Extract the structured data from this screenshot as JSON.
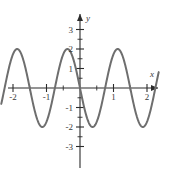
{
  "chart_data": {
    "type": "line",
    "title": "",
    "xlabel": "x",
    "ylabel": "y",
    "xlim": [
      -2.35,
      2.35
    ],
    "ylim": [
      -3.55,
      3.55
    ],
    "grid": false,
    "legend": "none",
    "curve_color": "#6e6e6e",
    "axis_color": "#2b2b2b",
    "label_color": "#3a3a3a",
    "x_ticks": [
      -2,
      -1,
      1,
      2
    ],
    "x_tick_labels": [
      "-2",
      "-1",
      "1",
      "2"
    ],
    "y_ticks": [
      -3,
      -2,
      -1,
      1,
      2,
      3
    ],
    "y_tick_labels": [
      "-3",
      "-2",
      "-1",
      "1",
      "2",
      "3"
    ],
    "minor_x_ticks": [
      -1.5,
      -0.5,
      0.5,
      1.5
    ],
    "minor_y_ticks": [
      -2.5,
      -1.5,
      -0.5,
      0.5,
      1.5,
      2.5
    ],
    "series": [
      {
        "name": "curve",
        "description": "sinusoid amplitude 2 period 1.5",
        "amplitude": 2,
        "period": 1.5,
        "phase": 0,
        "x": [
          -2.3,
          -2.2,
          -2.1,
          -2.0,
          -1.9,
          -1.8,
          -1.7,
          -1.6,
          -1.5,
          -1.4,
          -1.3,
          -1.2,
          -1.1,
          -1.0,
          -0.9,
          -0.8,
          -0.7,
          -0.6,
          -0.5,
          -0.4,
          -0.3,
          -0.2,
          -0.1,
          0.0,
          0.1,
          0.2,
          0.3,
          0.4,
          0.5,
          0.6,
          0.7,
          0.8,
          0.9,
          1.0,
          1.1,
          1.2,
          1.3,
          1.4,
          1.5,
          1.6,
          1.7,
          1.8,
          1.9,
          2.0,
          2.1,
          2.2,
          2.3
        ],
        "y": [
          -1.73,
          -1.0,
          -0.0,
          1.0,
          1.73,
          2.0,
          1.73,
          1.0,
          0.0,
          -1.0,
          -1.73,
          -2.0,
          -1.73,
          -1.0,
          0.0,
          1.0,
          1.73,
          2.0,
          1.73,
          1.0,
          0.0,
          -1.0,
          -1.73,
          -2.0,
          -1.73,
          -1.0,
          0.0,
          1.0,
          1.73,
          2.0,
          1.73,
          1.0,
          0.0,
          -1.0,
          -1.73,
          -2.0,
          -1.73,
          -1.0,
          0.0,
          1.0,
          1.73,
          2.0,
          1.73,
          1.0,
          0.0,
          -1.0,
          -1.73
        ]
      }
    ],
    "maxima": [
      {
        "x": -1.8,
        "y": 2
      },
      {
        "x": -0.6,
        "y": 2
      },
      {
        "x": 0.6,
        "y": 2
      },
      {
        "x": 1.8,
        "y": 2
      }
    ],
    "minima": [
      {
        "x": -1.2,
        "y": -2
      },
      {
        "x": 0.0,
        "y": -2
      },
      {
        "x": 1.2,
        "y": -2
      }
    ],
    "zero_crossings": [
      -2.1,
      -1.5,
      -0.9,
      -0.3,
      0.3,
      0.9,
      1.5,
      2.1
    ]
  },
  "axes": {
    "x_axis_label": "x",
    "y_axis_label": "y"
  }
}
